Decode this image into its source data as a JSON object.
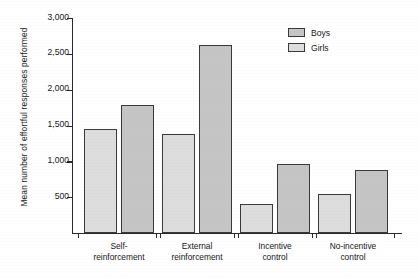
{
  "chart_data": {
    "type": "bar",
    "title": "",
    "xlabel": "",
    "ylabel": "Mean number of effortful responses performed",
    "ylim": [
      0,
      3000
    ],
    "yticks": [
      "500",
      "1,000",
      "1,500",
      "2,000",
      "2,500",
      "3,000"
    ],
    "ytick_values": [
      500,
      1000,
      1500,
      2000,
      2500,
      3000
    ],
    "grid": false,
    "legend_position": "top-right",
    "categories": [
      "Self-\nreinforcement",
      "External\nreinforcement",
      "Incentive\ncontrol",
      "No-incentive\ncontrol"
    ],
    "category_lines": [
      [
        "Self-",
        "reinforcement"
      ],
      [
        "External",
        "reinforcement"
      ],
      [
        "Incentive",
        "control"
      ],
      [
        "No-incentive",
        "control"
      ]
    ],
    "series": [
      {
        "name": "Boys",
        "color": "#dddddd",
        "values": [
          1450,
          1380,
          400,
          545
        ]
      },
      {
        "name": "Girls",
        "color": "#c5c5c5",
        "values": [
          1780,
          2630,
          965,
          880
        ]
      }
    ]
  },
  "legend": {
    "items": [
      {
        "label": "Boys"
      },
      {
        "label": "Girls"
      }
    ]
  }
}
